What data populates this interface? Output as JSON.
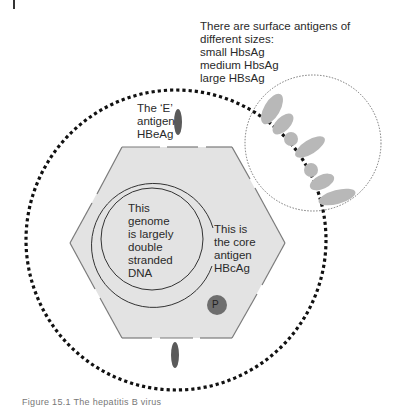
{
  "figure": {
    "caption": "Figure 15.1   The hepatitis B virus",
    "colors": {
      "hexagon_fill": "#e3e3e3",
      "hexagon_edge": "#7a7a7a",
      "surface_antigen": "#b8b8b8",
      "e_antigen": "#5a5a5a",
      "polymerase": "#6e6e6e",
      "envelope": "#111111"
    },
    "labels": {
      "surface_antigens": [
        "There are surface antigens of",
        "different sizes:",
        "small HbsAg",
        "medium HbsAg",
        "large HBsAg"
      ],
      "e_antigen": [
        "The ‘E’",
        "antigen",
        "HBeAg"
      ],
      "genome": [
        "This",
        "genome",
        "is largely",
        "double",
        "stranded",
        "DNA"
      ],
      "core_antigen": [
        "This is",
        "the core",
        "antigen",
        "HBcAg"
      ],
      "polymerase": "P"
    }
  }
}
